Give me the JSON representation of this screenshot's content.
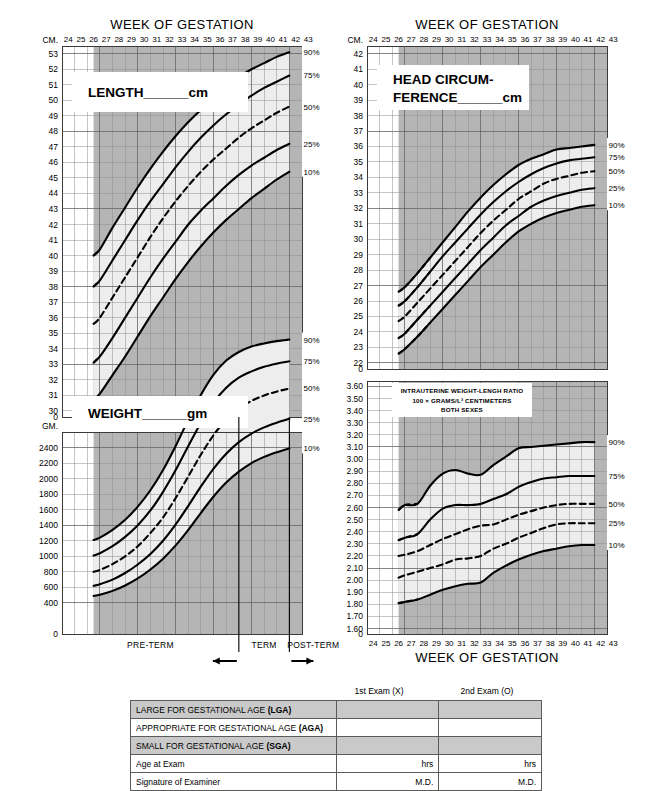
{
  "meta": {
    "doc_title": "Newborn Classification - Intrauterine Growth Charts",
    "colors": {
      "band_light": "#ededed",
      "out_of_band": "#b5b5b5",
      "grid_minor": "#8f8f8f",
      "grid_major": "#5b5b5b",
      "curve": "#000000",
      "table_shade": "#c9c9c9"
    }
  },
  "axis": {
    "x_title": "WEEK OF GESTATION",
    "x_ticks": [
      "24",
      "25",
      "26",
      "27",
      "28",
      "29",
      "30",
      "31",
      "32",
      "33",
      "34",
      "35",
      "36",
      "37",
      "38",
      "39",
      "40",
      "41",
      "42",
      "43"
    ],
    "x_min": 24,
    "x_max": 43
  },
  "percentiles": {
    "p90": "90%",
    "p75": "75%",
    "p50": "50%",
    "p25": "25%",
    "p10": "10%"
  },
  "term_bar": {
    "preterm": "PRE-TERM",
    "term": "TERM",
    "postterm": "POST-TERM",
    "left_arrow": "←",
    "right_arrow": "→"
  },
  "length_chart": {
    "box_label_main": "LENGTH",
    "box_label_blank": "______",
    "box_label_unit": "cm",
    "unit": "CM.",
    "y_ticks": [
      "53",
      "52",
      "51",
      "50",
      "49",
      "48",
      "47",
      "46",
      "45",
      "44",
      "43",
      "42",
      "41",
      "40",
      "39",
      "38",
      "37",
      "36",
      "35",
      "34",
      "33",
      "32",
      "31",
      "30",
      "0"
    ]
  },
  "weight_chart": {
    "box_label_main": "WEIGHT",
    "box_label_blank": "______",
    "box_label_unit": "gm",
    "unit": "GM.",
    "y_ticks": [
      "2400",
      "2200",
      "2000",
      "1800",
      "1600",
      "1400",
      "1200",
      "1000",
      "800",
      "600",
      "400",
      "0"
    ]
  },
  "head_chart": {
    "box_label_line1": "HEAD CIRCUM-",
    "box_label_line2": "FERENCE",
    "box_label_blank": "______",
    "box_label_unit": "cm",
    "unit": "CM.",
    "y_ticks": [
      "42",
      "41",
      "40",
      "39",
      "38",
      "37",
      "36",
      "35",
      "34",
      "33",
      "32",
      "31",
      "30",
      "29",
      "28",
      "27",
      "26",
      "25",
      "24",
      "23",
      "22",
      "0"
    ]
  },
  "ratio_chart": {
    "note_line1": "INTRAUTERINE WEIGHT-LENGH RATIO",
    "note_line2": "100 × GRAMS/L³ CENTIMETERS",
    "note_line3": "BOTH SEXES",
    "x_title_bottom": "WEEK OF GESTATION",
    "y_ticks": [
      "3.60",
      "3.50",
      "3.40",
      "3.30",
      "3.20",
      "3.10",
      "3.00",
      "2.90",
      "2.80",
      "2.70",
      "2.60",
      "2.50",
      "2.40",
      "2.30",
      "2.20",
      "2.10",
      "2.00",
      "1.90",
      "1.80",
      "1.70",
      "1.60",
      "0"
    ]
  },
  "exam_table": {
    "col_headers": [
      "1st Exam (X)",
      "2nd Exam (O)"
    ],
    "rows": [
      {
        "label_plain": "LARGE FOR GESTATIONAL AGE ",
        "label_bold": "(LGA)",
        "shaded": true,
        "v1": "",
        "v2": ""
      },
      {
        "label_plain": "APPROPRIATE FOR GESTATIONAL AGE ",
        "label_bold": "(AGA)",
        "shaded": false,
        "v1": "",
        "v2": ""
      },
      {
        "label_plain": "SMALL FOR GESTATIONAL AGE ",
        "label_bold": "(SGA)",
        "shaded": true,
        "v1": "",
        "v2": ""
      },
      {
        "label_plain": "Age at Exam",
        "label_bold": "",
        "shaded": false,
        "v1": "hrs",
        "v2": "hrs"
      },
      {
        "label_plain": "Signature of Examiner",
        "label_bold": "",
        "shaded": false,
        "v1": "M.D.",
        "v2": "M.D."
      }
    ]
  },
  "chart_data": [
    {
      "type": "line",
      "id": "length",
      "title": "LENGTH cm",
      "xlabel": "WEEK OF GESTATION",
      "ylabel": "CM.",
      "xlim": [
        24,
        43
      ],
      "ylim": [
        30,
        53
      ],
      "grid": true,
      "legend_position": "right",
      "x": [
        26.5,
        27,
        28,
        29,
        30,
        31,
        32,
        33,
        34,
        35,
        36,
        37,
        38,
        39,
        40,
        41,
        42
      ],
      "series": [
        {
          "name": "90%",
          "values": [
            40.0,
            40.4,
            41.8,
            43.1,
            44.4,
            45.6,
            46.7,
            47.7,
            48.6,
            49.4,
            50.2,
            50.9,
            51.5,
            52.0,
            52.4,
            52.8,
            53.1
          ]
        },
        {
          "name": "75%",
          "values": [
            38.0,
            38.4,
            39.7,
            41.0,
            42.3,
            43.5,
            44.6,
            45.7,
            46.7,
            47.6,
            48.4,
            49.1,
            49.7,
            50.3,
            50.8,
            51.2,
            51.6
          ]
        },
        {
          "name": "50%",
          "values": [
            35.6,
            36.0,
            37.3,
            38.6,
            39.9,
            41.2,
            42.4,
            43.5,
            44.5,
            45.4,
            46.2,
            46.9,
            47.6,
            48.2,
            48.7,
            49.2,
            49.6
          ]
        },
        {
          "name": "25%",
          "values": [
            33.1,
            33.5,
            34.7,
            36.0,
            37.3,
            38.6,
            39.8,
            40.9,
            42.0,
            42.9,
            43.7,
            44.5,
            45.2,
            45.8,
            46.3,
            46.8,
            47.2
          ]
        },
        {
          "name": "10%",
          "values": [
            30.7,
            31.1,
            32.3,
            33.5,
            34.8,
            36.1,
            37.3,
            38.5,
            39.6,
            40.6,
            41.5,
            42.3,
            43.0,
            43.7,
            44.3,
            44.9,
            45.4
          ]
        }
      ]
    },
    {
      "type": "line",
      "id": "weight",
      "title": "WEIGHT gm",
      "xlabel": "WEEK OF GESTATION",
      "ylabel": "GM.",
      "xlim": [
        24,
        43
      ],
      "ylim": [
        0,
        2600
      ],
      "grid": true,
      "legend_position": "right",
      "x": [
        26.5,
        27,
        28,
        29,
        30,
        31,
        32,
        33,
        34,
        35,
        36,
        37,
        38,
        39,
        40,
        41,
        42
      ],
      "series": [
        {
          "name": "90%",
          "values": [
            1210,
            1240,
            1340,
            1470,
            1640,
            1850,
            2110,
            2420,
            2760,
            3080,
            3340,
            3520,
            3630,
            3700,
            3740,
            3770,
            3790
          ]
        },
        {
          "name": "75%",
          "values": [
            1010,
            1040,
            1130,
            1250,
            1400,
            1590,
            1830,
            2110,
            2420,
            2720,
            2980,
            3170,
            3300,
            3380,
            3440,
            3480,
            3510
          ]
        },
        {
          "name": "50%",
          "values": [
            800,
            825,
            900,
            1000,
            1130,
            1300,
            1500,
            1750,
            2030,
            2310,
            2560,
            2760,
            2900,
            3000,
            3070,
            3120,
            3160
          ]
        },
        {
          "name": "25%",
          "values": [
            620,
            640,
            700,
            785,
            895,
            1030,
            1200,
            1410,
            1650,
            1900,
            2130,
            2320,
            2470,
            2580,
            2660,
            2720,
            2770
          ]
        },
        {
          "name": "10%",
          "values": [
            490,
            505,
            555,
            625,
            715,
            830,
            970,
            1140,
            1340,
            1560,
            1770,
            1950,
            2090,
            2200,
            2280,
            2340,
            2390
          ]
        }
      ]
    },
    {
      "type": "line",
      "id": "head_circumference",
      "title": "HEAD CIRCUMFERENCE cm",
      "xlabel": "WEEK OF GESTATION",
      "ylabel": "CM.",
      "xlim": [
        24,
        43
      ],
      "ylim": [
        22,
        42
      ],
      "grid": true,
      "legend_position": "right",
      "x": [
        26.5,
        27,
        28,
        29,
        30,
        31,
        32,
        33,
        34,
        35,
        36,
        37,
        38,
        39,
        40,
        41,
        42
      ],
      "series": [
        {
          "name": "90%",
          "values": [
            26.6,
            26.9,
            27.8,
            28.8,
            29.8,
            30.8,
            31.8,
            32.7,
            33.5,
            34.2,
            34.8,
            35.2,
            35.5,
            35.8,
            35.9,
            36.0,
            36.1
          ]
        },
        {
          "name": "75%",
          "values": [
            25.7,
            26.0,
            26.9,
            27.9,
            28.9,
            29.8,
            30.7,
            31.6,
            32.4,
            33.1,
            33.7,
            34.2,
            34.6,
            34.9,
            35.1,
            35.2,
            35.3
          ]
        },
        {
          "name": "50%",
          "values": [
            24.7,
            25.0,
            25.9,
            26.8,
            27.7,
            28.6,
            29.5,
            30.4,
            31.2,
            31.9,
            32.6,
            33.1,
            33.6,
            33.9,
            34.1,
            34.3,
            34.4
          ]
        },
        {
          "name": "25%",
          "values": [
            23.6,
            23.9,
            24.8,
            25.7,
            26.6,
            27.5,
            28.4,
            29.3,
            30.1,
            30.9,
            31.5,
            32.1,
            32.5,
            32.8,
            33.0,
            33.2,
            33.3
          ]
        },
        {
          "name": "10%",
          "values": [
            22.6,
            22.9,
            23.7,
            24.6,
            25.5,
            26.4,
            27.3,
            28.2,
            29.0,
            29.8,
            30.5,
            31.0,
            31.4,
            31.7,
            31.9,
            32.1,
            32.2
          ]
        }
      ]
    },
    {
      "type": "line",
      "id": "weight_length_ratio",
      "title": "INTRAUTERINE WEIGHT-LENGH RATIO",
      "subtitle": "100 × GRAMS/L³ CENTIMETERS  BOTH SEXES",
      "xlabel": "WEEK OF GESTATION",
      "ylabel": "ratio",
      "xlim": [
        24,
        43
      ],
      "ylim": [
        1.6,
        3.6
      ],
      "grid": true,
      "legend_position": "right",
      "x": [
        26.5,
        27,
        28,
        29,
        30,
        31,
        32,
        33,
        34,
        35,
        36,
        37,
        38,
        39,
        40,
        41,
        42
      ],
      "series": [
        {
          "name": "90%",
          "values": [
            2.58,
            2.62,
            2.63,
            2.78,
            2.88,
            2.91,
            2.88,
            2.87,
            2.95,
            3.02,
            3.09,
            3.1,
            3.11,
            3.12,
            3.13,
            3.14,
            3.14
          ]
        },
        {
          "name": "75%",
          "values": [
            2.33,
            2.35,
            2.38,
            2.5,
            2.59,
            2.62,
            2.62,
            2.63,
            2.67,
            2.71,
            2.77,
            2.81,
            2.84,
            2.85,
            2.86,
            2.86,
            2.86
          ]
        },
        {
          "name": "50%",
          "values": [
            2.2,
            2.21,
            2.24,
            2.29,
            2.34,
            2.38,
            2.42,
            2.45,
            2.46,
            2.5,
            2.54,
            2.57,
            2.6,
            2.62,
            2.63,
            2.63,
            2.63
          ]
        },
        {
          "name": "25%",
          "values": [
            2.02,
            2.04,
            2.07,
            2.1,
            2.13,
            2.17,
            2.18,
            2.2,
            2.26,
            2.3,
            2.35,
            2.39,
            2.43,
            2.46,
            2.47,
            2.47,
            2.47
          ]
        },
        {
          "name": "10%",
          "values": [
            1.81,
            1.82,
            1.84,
            1.88,
            1.92,
            1.95,
            1.97,
            1.98,
            2.06,
            2.12,
            2.17,
            2.21,
            2.24,
            2.26,
            2.28,
            2.29,
            2.29
          ]
        }
      ]
    }
  ]
}
